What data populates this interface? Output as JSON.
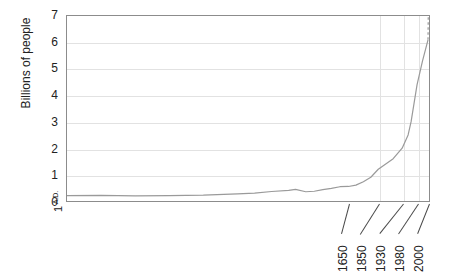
{
  "chart_data": {
    "type": "line",
    "title": "",
    "xlabel": "",
    "ylabel": "Billions of people",
    "ylim": [
      0,
      7
    ],
    "xlim": [
      1,
      2050
    ],
    "grid": true,
    "legend": null,
    "y_ticks": [
      "7",
      "6",
      "5",
      "4",
      "3",
      "2",
      "1",
      "0"
    ],
    "y_tick_values": [
      7,
      6,
      5,
      4,
      3,
      2,
      1,
      0
    ],
    "x_ticks": [
      "1650",
      "1850",
      "1930",
      "1980",
      "2000"
    ],
    "x_tick_values": [
      1650,
      1850,
      1930,
      1980,
      2000
    ],
    "origin_label_number": "1",
    "origin_label_era": "A.D.",
    "series": [
      {
        "name": "World population",
        "style": "solid",
        "color": "#9a9a9a",
        "x": [
          1,
          200,
          400,
          600,
          800,
          1000,
          1100,
          1200,
          1300,
          1340,
          1400,
          1450,
          1500,
          1550,
          1600,
          1650,
          1700,
          1750,
          1800,
          1850,
          1900,
          1930,
          1950,
          1960,
          1970,
          1980,
          1990,
          2000
        ],
        "y": [
          0.2,
          0.21,
          0.19,
          0.2,
          0.22,
          0.27,
          0.3,
          0.36,
          0.4,
          0.44,
          0.35,
          0.37,
          0.43,
          0.48,
          0.54,
          0.55,
          0.6,
          0.73,
          0.9,
          1.2,
          1.6,
          2.0,
          2.5,
          3.0,
          3.7,
          4.4,
          5.3,
          6.1
        ]
      },
      {
        "name": "Projection",
        "style": "dashed",
        "color": "#9a9a9a",
        "x": [
          2000,
          2010,
          2020,
          2030,
          2040,
          2050
        ],
        "y": [
          6.1,
          6.8,
          7.5,
          8.1,
          8.6,
          9.0
        ]
      }
    ],
    "annotations": [
      {
        "label": "Black Death dip",
        "x": 1350,
        "y": 0.35
      }
    ]
  },
  "axes": {
    "y_title": "Billions of people"
  }
}
